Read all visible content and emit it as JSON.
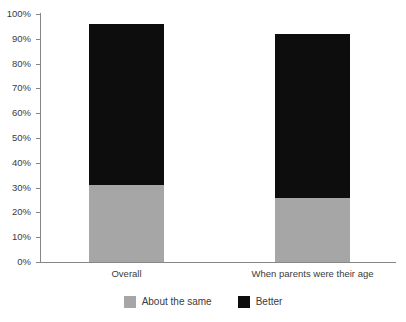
{
  "chart_data": {
    "type": "bar",
    "subtype": "stacked-column",
    "title": "",
    "xlabel": "",
    "ylabel": "",
    "categories": [
      "Overall",
      "When parents were their age"
    ],
    "series": [
      {
        "name": "About the same",
        "values": [
          31,
          26
        ],
        "color": "#a6a6a6"
      },
      {
        "name": "Better",
        "values": [
          65,
          66
        ],
        "color": "#0d0d0d"
      }
    ],
    "totals": [
      96,
      92
    ],
    "ylim": [
      0,
      100
    ],
    "ytick_values": [
      0,
      10,
      20,
      30,
      40,
      50,
      60,
      70,
      80,
      90,
      100
    ],
    "ytick_labels": [
      "0%",
      "10%",
      "20%",
      "30%",
      "40%",
      "50%",
      "60%",
      "70%",
      "80%",
      "90%",
      "100%"
    ],
    "grid": false,
    "legend": [
      "About the same",
      "Better"
    ],
    "legend_position": "bottom-center"
  },
  "axes": {
    "y": {
      "ticks": [
        {
          "label": "100%",
          "value": 100
        },
        {
          "label": "90%",
          "value": 90
        },
        {
          "label": "80%",
          "value": 80
        },
        {
          "label": "70%",
          "value": 70
        },
        {
          "label": "60%",
          "value": 60
        },
        {
          "label": "50%",
          "value": 50
        },
        {
          "label": "40%",
          "value": 40
        },
        {
          "label": "30%",
          "value": 30
        },
        {
          "label": "20%",
          "value": 20
        },
        {
          "label": "10%",
          "value": 10
        },
        {
          "label": "0%",
          "value": 0
        }
      ]
    },
    "x": {
      "categories": [
        {
          "label": "Overall"
        },
        {
          "label": "When parents were their age"
        }
      ]
    }
  },
  "legend": {
    "items": [
      {
        "label": "About the same",
        "color": "#a6a6a6"
      },
      {
        "label": "Better",
        "color": "#0d0d0d"
      }
    ]
  },
  "colors": {
    "about_the_same": "#a6a6a6",
    "better": "#0d0d0d",
    "axis": "#868686",
    "text": "#3b3b3b",
    "background": "#ffffff"
  }
}
